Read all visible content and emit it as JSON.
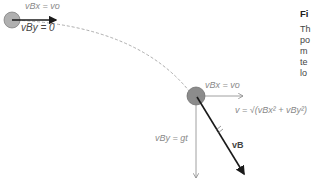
{
  "diagram": {
    "top_ball": {
      "vx_label": "vBx = vo",
      "vy_label": "vBy = 0"
    },
    "bottom_ball": {
      "vx_label": "vBx = vo",
      "v_label": "v = √(vBx² + vBy²)",
      "vy_label": "vBy = gt",
      "vb_label": "vB"
    },
    "colors": {
      "ball": "#9a9a9a",
      "arrow_dark": "#1a1a1a",
      "arrow_light": "#888888",
      "trajectory": "#999999"
    }
  },
  "sidebar": {
    "title": "Fi",
    "lines": [
      "Th",
      "po",
      "m",
      "te",
      "lo"
    ]
  }
}
